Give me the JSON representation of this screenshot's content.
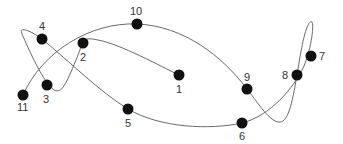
{
  "diagram": {
    "type": "numbered-point-path",
    "colors": {
      "line": "#6a6a6a",
      "point": "#111111",
      "label": "#333333",
      "background": "#ffffff"
    },
    "points": [
      {
        "label": "1"
      },
      {
        "label": "2"
      },
      {
        "label": "3"
      },
      {
        "label": "4"
      },
      {
        "label": "5"
      },
      {
        "label": "6"
      },
      {
        "label": "7"
      },
      {
        "label": "8"
      },
      {
        "label": "9"
      },
      {
        "label": "10"
      },
      {
        "label": "11"
      }
    ],
    "order": [
      "1",
      "2",
      "3",
      "4",
      "5",
      "6",
      "7",
      "8",
      "9",
      "10",
      "11"
    ]
  }
}
